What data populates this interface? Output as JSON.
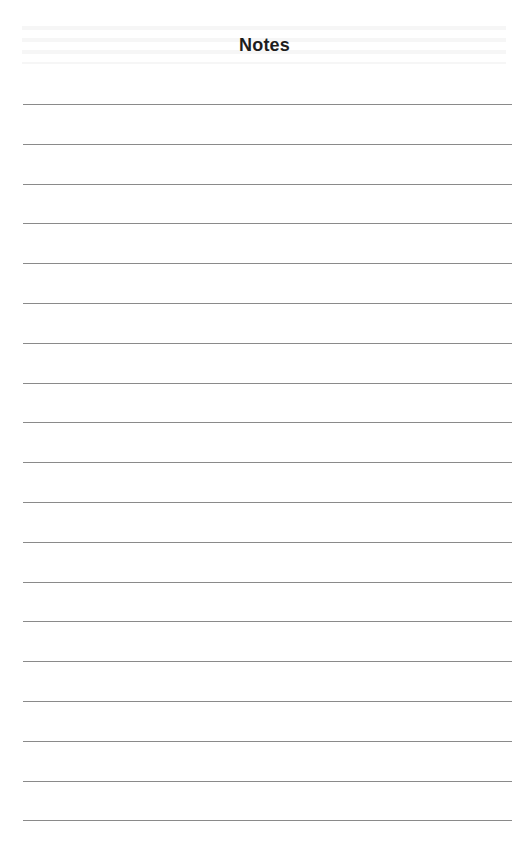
{
  "page": {
    "title": "Notes",
    "line_count": 19,
    "first_line_y": 104,
    "line_spacing": 39.8,
    "line_color": "#8a8a8a"
  }
}
